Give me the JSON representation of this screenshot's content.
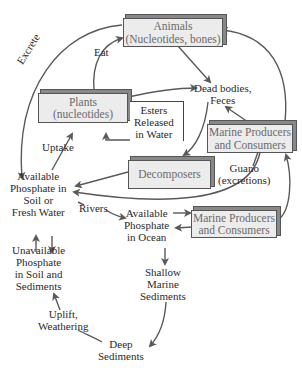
{
  "diagram": {
    "boxes": {
      "animals": {
        "line1": "Animals",
        "line2": "(Nucleotides, bones)"
      },
      "plants": {
        "line1": "Plants",
        "line2": "(nucleotides)"
      },
      "marine_top": {
        "line1": "Marine Producers",
        "line2": "and Consumers"
      },
      "decomposers": {
        "line1": "Decomposers"
      },
      "marine_bottom": {
        "line1": "Marine Producers",
        "line2": "and Consumers"
      }
    },
    "labels": {
      "excrete": "Excrete",
      "eat": "Eat",
      "dead_bodies": {
        "line1": "Dead bodies,",
        "line2": "Feces"
      },
      "esters": {
        "line1": "Esters",
        "line2": "Released",
        "line3": "in Water"
      },
      "uptake": "Uptake",
      "available_soil": {
        "line1": "Available",
        "line2": "Phosphate in",
        "line3": "Soil or",
        "line4": "Fresh Water"
      },
      "guano": {
        "line1": "Guano",
        "line2": "(excretions)"
      },
      "rivers": "Rivers",
      "available_ocean": {
        "line1": "Available",
        "line2": "Phosphate",
        "line3": "in Ocean"
      },
      "unavailable": {
        "line1": "Unavailable",
        "line2": "Phosphate",
        "line3": "in Soil and",
        "line4": "Sediments"
      },
      "shallow": {
        "line1": "Shallow",
        "line2": "Marine",
        "line3": "Sediments"
      },
      "uplift": {
        "line1": "Uplift,",
        "line2": "Weathering"
      },
      "deep": {
        "line1": "Deep",
        "line2": "Sediments"
      }
    },
    "colors": {
      "arrow": "#5a5a5a",
      "box_fill": "#ececec",
      "box_border": "#555555",
      "box_text": "#6a6a6a"
    }
  }
}
